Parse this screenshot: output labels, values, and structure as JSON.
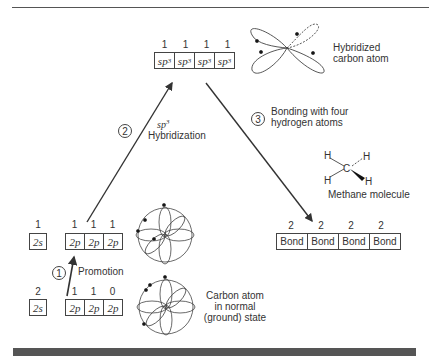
{
  "figure": {
    "hybridized_orbitals": {
      "occupancy": [
        "1",
        "1",
        "1",
        "1"
      ],
      "cells": [
        "sp",
        "sp",
        "sp",
        "sp"
      ],
      "superscript": "3"
    },
    "hybridized_label": [
      "Hybridized",
      "carbon atom"
    ],
    "step2": {
      "number": "2",
      "label_sp": "sp",
      "label_sup": "3",
      "label": "Hybridization"
    },
    "step3": {
      "number": "3",
      "label": [
        "Bonding with four",
        "hydrogen atoms"
      ]
    },
    "methane": {
      "atoms": {
        "h1": "H",
        "h2": "H",
        "h3": "H",
        "h4": "H",
        "c": "C"
      },
      "label": "Methane molecule"
    },
    "bonds": {
      "occupancy": [
        "2",
        "2",
        "2",
        "2"
      ],
      "cells": [
        "Bond",
        "Bond",
        "Bond",
        "Bond"
      ]
    },
    "promoted_state": {
      "s_occupancy": "1",
      "s_cell": "2s",
      "p_occupancy": [
        "1",
        "1",
        "1"
      ],
      "p_cells": [
        "2p",
        "2p",
        "2p"
      ]
    },
    "step1": {
      "number": "1",
      "label": "Promotion"
    },
    "ground_state": {
      "s_occupancy": "2",
      "s_cell": "2s",
      "p_occupancy": [
        "1",
        "1",
        "0"
      ],
      "p_cells": [
        "2p",
        "2p",
        "2p"
      ],
      "label": [
        "Carbon atom",
        "in normal",
        "(ground) state"
      ]
    }
  }
}
